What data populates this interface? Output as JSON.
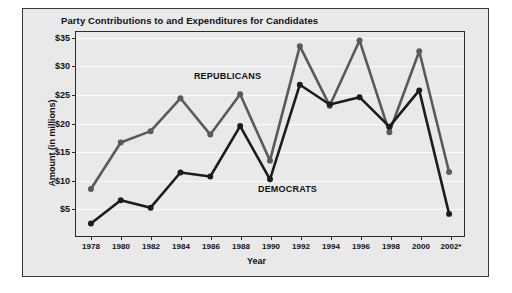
{
  "chart_data": {
    "type": "line",
    "title": "Party Contributions to and Expenditures for Candidates",
    "xlabel": "Year",
    "ylabel": "Amount (in millions)",
    "categories": [
      "1978",
      "1980",
      "1982",
      "1984",
      "1986",
      "1988",
      "1990",
      "1992",
      "1994",
      "1996",
      "1998",
      "2000",
      "2002*"
    ],
    "ytick_labels": [
      "$5",
      "$10",
      "$15",
      "$20",
      "$25",
      "$30",
      "$35"
    ],
    "ytick_values": [
      5,
      10,
      15,
      20,
      25,
      30,
      35
    ],
    "ylim": [
      0,
      36
    ],
    "grid": true,
    "legend_position": "inline-annotations",
    "series": [
      {
        "name": "REPUBLICANS",
        "color": "#5a5a5a",
        "values": [
          8.3,
          16.5,
          18.5,
          24.3,
          17.9,
          25.0,
          13.3,
          33.5,
          23.0,
          34.5,
          18.3,
          32.6,
          11.3
        ]
      },
      {
        "name": "DEMOCRATS",
        "color": "#1c1c1c",
        "values": [
          2.2,
          6.3,
          5.0,
          11.2,
          10.5,
          19.4,
          10.0,
          26.7,
          23.2,
          24.5,
          19.3,
          25.7,
          3.9
        ]
      }
    ],
    "annotations": [
      {
        "text": "REPUBLICANS",
        "x": 4.55,
        "y": 28.3
      },
      {
        "text": "DEMOCRATS",
        "x": 6.55,
        "y": 8.6
      }
    ]
  }
}
